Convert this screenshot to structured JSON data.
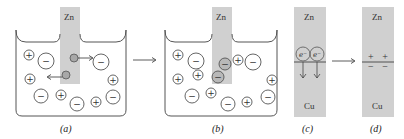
{
  "panels": [
    {
      "id": "a",
      "label": "(a)",
      "electrode": "Zn"
    },
    {
      "id": "b",
      "label": "(b)",
      "electrode": "Zn"
    },
    {
      "id": "c",
      "label": "(c)",
      "top": "Zn",
      "bottom": "Cu",
      "electron_label": "e−"
    },
    {
      "id": "d",
      "label": "(d)",
      "top": "Zn",
      "bottom": "Cu",
      "charges_top": "+ +",
      "charges_bottom": "− −"
    }
  ],
  "colors": {
    "electrode": "#d0d0d0",
    "line": "#555555",
    "ion_fill": "#ffffff",
    "atom_fill": "#a8a8a8"
  }
}
